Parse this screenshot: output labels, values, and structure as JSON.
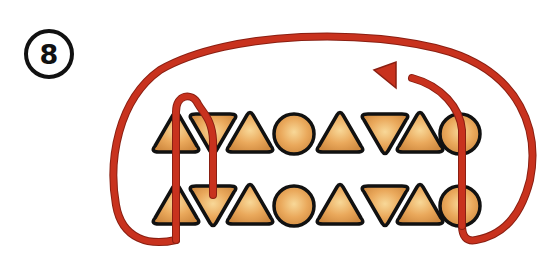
{
  "step": {
    "number": "8"
  },
  "colors": {
    "thread": "#c8321e",
    "thread_edge": "#8a1f12",
    "bead_light": "#f6cf8a",
    "bead_mid": "#e9a95c",
    "bead_dark": "#c9853e",
    "outline": "#111111"
  },
  "rows": [
    {
      "name": "top-row",
      "y": 134,
      "beads": [
        "triangle",
        "inverted-triangle",
        "triangle",
        "circle",
        "triangle",
        "inverted-triangle",
        "triangle",
        "circle"
      ]
    },
    {
      "name": "bottom-row",
      "y": 206,
      "beads": [
        "triangle",
        "inverted-triangle",
        "triangle",
        "circle",
        "triangle",
        "inverted-triangle",
        "triangle",
        "circle"
      ]
    }
  ],
  "bead_x": [
    176,
    213,
    250,
    294,
    340,
    385,
    420,
    460
  ]
}
